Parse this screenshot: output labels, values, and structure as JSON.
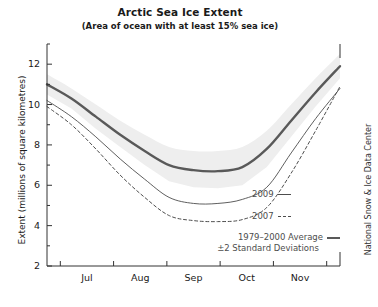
{
  "chart_data": {
    "type": "line",
    "title": "Arctic Sea Ice Extent",
    "subtitle": "(Area of ocean with at least 15% sea ice)",
    "xlabel": "",
    "ylabel": "Extent (millions of square kilometres)",
    "credit": "National Snow & Ice Data Center",
    "grid": false,
    "legend_position": "inside-bottom-right",
    "ylim": [
      2,
      13
    ],
    "yticks": [
      2,
      4,
      6,
      8,
      10,
      12
    ],
    "ytick_labels": [
      "2",
      "4",
      "6",
      "8",
      "10",
      "12"
    ],
    "xlim": [
      "Jun 15",
      "Dec 01"
    ],
    "xtick_labels": [
      "Jul",
      "Aug",
      "Sep",
      "Oct",
      "Nov"
    ],
    "x": [
      "Jun 15",
      "Jul 01",
      "Jul 15",
      "Aug 01",
      "Aug 15",
      "Sep 01",
      "Sep 10",
      "Sep 20",
      "Oct 01",
      "Oct 15",
      "Nov 01",
      "Nov 15",
      "Dec 01"
    ],
    "series": [
      {
        "name": "1979–2000 Average",
        "style": "thick-solid",
        "color": "#595959",
        "values": [
          11.0,
          10.3,
          9.4,
          8.5,
          7.7,
          7.0,
          6.75,
          6.7,
          6.9,
          7.8,
          9.2,
          10.6,
          11.9
        ]
      },
      {
        "name": "2009",
        "style": "thin-solid",
        "color": "#4d4d4d",
        "values": [
          10.2,
          9.4,
          8.4,
          7.3,
          6.3,
          5.4,
          5.1,
          5.1,
          5.3,
          5.9,
          7.6,
          9.3,
          10.8
        ]
      },
      {
        "name": "2007",
        "style": "dashed",
        "color": "#4d4d4d",
        "values": [
          9.9,
          9.0,
          7.8,
          6.5,
          5.4,
          4.5,
          4.25,
          4.2,
          4.3,
          4.9,
          6.6,
          8.7,
          10.9
        ]
      }
    ],
    "band": {
      "name": "±2 Standard Deviations",
      "color": "#eeeeee",
      "upper": [
        11.5,
        10.8,
        10.0,
        9.2,
        8.5,
        7.9,
        7.7,
        7.7,
        7.9,
        8.7,
        10.0,
        11.3,
        12.5
      ],
      "lower": [
        10.5,
        9.8,
        8.8,
        7.9,
        7.0,
        6.2,
        5.9,
        5.85,
        6.0,
        6.9,
        8.4,
        9.9,
        11.3
      ]
    }
  },
  "legend": {
    "item_2009": "2009",
    "item_2007": "2007",
    "item_average": "1979–2000 Average",
    "item_stddev": "±2 Standard Deviations"
  }
}
